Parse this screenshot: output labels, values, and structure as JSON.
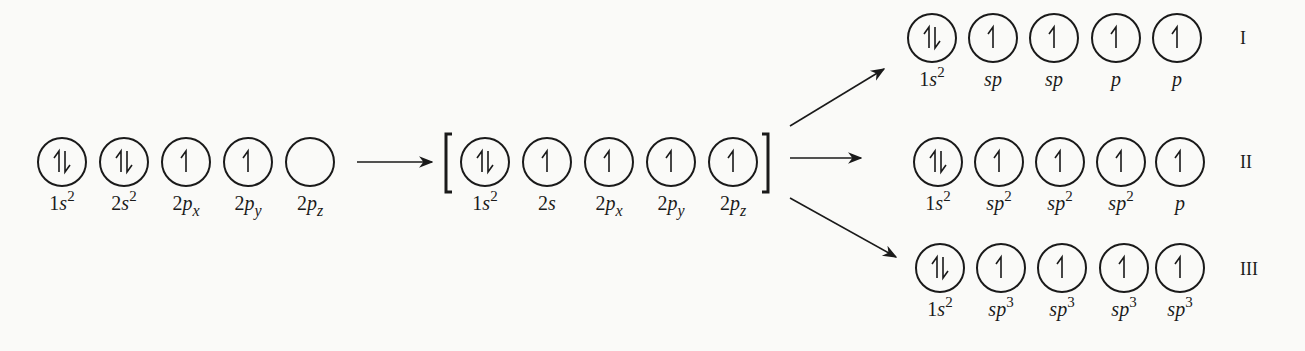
{
  "diagram": {
    "type": "orbital-hybridization",
    "ground_state": {
      "orbitals": [
        {
          "label": "1s",
          "sup": "2",
          "electrons": 2
        },
        {
          "label": "2s",
          "sup": "2",
          "electrons": 2
        },
        {
          "label": "2p",
          "sub": "x",
          "electrons": 1
        },
        {
          "label": "2p",
          "sub": "y",
          "electrons": 1
        },
        {
          "label": "2p",
          "sub": "z",
          "electrons": 0
        }
      ]
    },
    "excited_state": {
      "bracketed": true,
      "orbitals": [
        {
          "label": "1s",
          "sup": "2",
          "electrons": 2
        },
        {
          "label": "2s",
          "electrons": 1
        },
        {
          "label": "2p",
          "sub": "x",
          "electrons": 1
        },
        {
          "label": "2p",
          "sub": "y",
          "electrons": 1
        },
        {
          "label": "2p",
          "sub": "z",
          "electrons": 1
        }
      ]
    },
    "hybrid_states": [
      {
        "numeral": "I",
        "orbitals": [
          {
            "label": "1s",
            "sup": "2",
            "electrons": 2
          },
          {
            "label": "sp",
            "electrons": 1
          },
          {
            "label": "sp",
            "electrons": 1
          },
          {
            "label": "p",
            "electrons": 1
          },
          {
            "label": "p",
            "electrons": 1
          }
        ]
      },
      {
        "numeral": "II",
        "orbitals": [
          {
            "label": "1s",
            "sup": "2",
            "electrons": 2
          },
          {
            "label": "sp",
            "sup": "2",
            "electrons": 1
          },
          {
            "label": "sp",
            "sup": "2",
            "electrons": 1
          },
          {
            "label": "sp",
            "sup": "2",
            "electrons": 1
          },
          {
            "label": "p",
            "electrons": 1
          }
        ]
      },
      {
        "numeral": "III",
        "orbitals": [
          {
            "label": "1s",
            "sup": "2",
            "electrons": 2
          },
          {
            "label": "sp",
            "sup": "3",
            "electrons": 1
          },
          {
            "label": "sp",
            "sup": "3",
            "electrons": 1
          },
          {
            "label": "sp",
            "sup": "3",
            "electrons": 1
          },
          {
            "label": "sp",
            "sup": "3",
            "electrons": 1
          }
        ]
      }
    ],
    "colors": {
      "ink": "#1a1a1a",
      "background": "#fafaf8"
    }
  }
}
